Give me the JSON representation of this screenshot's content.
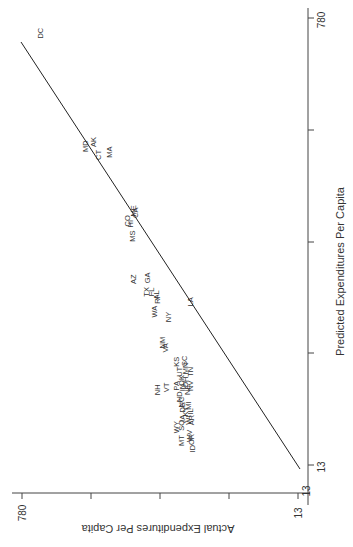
{
  "chart_data": {
    "type": "scatter",
    "orientation_note": "figure rotated 90 degrees counterclockwise",
    "title": "",
    "xlabel": "Predicted Expenditures Per Capita",
    "ylabel": "Actual Expenditures Per Capita",
    "xlim": [
      13,
      780
    ],
    "ylim": [
      13,
      780
    ],
    "x_tick_labels": [
      "13",
      "780"
    ],
    "y_tick_labels": [
      "13",
      "780"
    ],
    "grid": false,
    "legend": null,
    "fit_line": {
      "from": [
        13,
        13
      ],
      "to": [
        780,
        780
      ],
      "label": "45-degree reference / fitted line"
    },
    "points": [
      {
        "label": "DC",
        "predicted": 754,
        "actual": 723
      },
      {
        "label": "MD",
        "predicted": 560,
        "actual": 596
      },
      {
        "label": "AK",
        "predicted": 567,
        "actual": 574
      },
      {
        "label": "CT",
        "predicted": 545,
        "actual": 560
      },
      {
        "label": "MA",
        "predicted": 550,
        "actual": 530
      },
      {
        "label": "ME",
        "predicted": 449,
        "actual": 463
      },
      {
        "label": "CA",
        "predicted": 446,
        "actual": 458
      },
      {
        "label": "CO",
        "predicted": 432,
        "actual": 480
      },
      {
        "label": "HI",
        "predicted": 427,
        "actual": 471
      },
      {
        "label": "MS",
        "predicted": 406,
        "actual": 466
      },
      {
        "label": "GA",
        "predicted": 334,
        "actual": 424
      },
      {
        "label": "AZ",
        "predicted": 332,
        "actual": 463
      },
      {
        "label": "TX",
        "predicted": 310,
        "actual": 427
      },
      {
        "label": "FL",
        "predicted": 310,
        "actual": 413
      },
      {
        "label": "AL",
        "predicted": 305,
        "actual": 399
      },
      {
        "label": "RI",
        "predicted": 296,
        "actual": 396
      },
      {
        "label": "WA",
        "predicted": 276,
        "actual": 404
      },
      {
        "label": "NY",
        "predicted": 267,
        "actual": 365
      },
      {
        "label": "LA",
        "predicted": 293,
        "actual": 304
      },
      {
        "label": "NM",
        "predicted": 223,
        "actual": 382
      },
      {
        "label": "VA",
        "predicted": 214,
        "actual": 374
      },
      {
        "label": "KS",
        "predicted": 190,
        "actual": 343
      },
      {
        "label": "SC",
        "predicted": 192,
        "actual": 321
      },
      {
        "label": "MN",
        "predicted": 179,
        "actual": 318
      },
      {
        "label": "UT",
        "predicted": 173,
        "actual": 335
      },
      {
        "label": "OK",
        "predicted": 158,
        "actual": 329
      },
      {
        "label": "OH",
        "predicted": 155,
        "actual": 318
      },
      {
        "label": "TN",
        "predicted": 173,
        "actual": 304
      },
      {
        "label": "IN",
        "predicted": 146,
        "actual": 326
      },
      {
        "label": "NE",
        "predicted": 142,
        "actual": 313
      },
      {
        "label": "NV",
        "predicted": 149,
        "actual": 304
      },
      {
        "label": "NH",
        "predicted": 142,
        "actual": 396
      },
      {
        "label": "VT",
        "predicted": 146,
        "actual": 371
      },
      {
        "label": "PA",
        "predicted": 149,
        "actual": 343
      },
      {
        "label": "ND",
        "predicted": 130,
        "actual": 335
      },
      {
        "label": "NC",
        "predicted": 121,
        "actual": 329
      },
      {
        "label": "DE",
        "predicted": 112,
        "actual": 326
      },
      {
        "label": "KY",
        "predicted": 105,
        "actual": 318
      },
      {
        "label": "MI",
        "predicted": 115,
        "actual": 310
      },
      {
        "label": "IL",
        "predicted": 105,
        "actual": 304
      },
      {
        "label": "WI",
        "predicted": 90,
        "actual": 310
      },
      {
        "label": "AR",
        "predicted": 90,
        "actual": 301
      },
      {
        "label": "IA",
        "predicted": 93,
        "actual": 326
      },
      {
        "label": "SQ",
        "predicted": 81,
        "actual": 329
      },
      {
        "label": "WY",
        "predicted": 78,
        "actual": 343
      },
      {
        "label": "MT",
        "predicted": 55,
        "actual": 329
      },
      {
        "label": "WV",
        "predicted": 63,
        "actual": 307
      },
      {
        "label": "OR",
        "predicted": 57,
        "actual": 301
      },
      {
        "label": "ID",
        "predicted": 41,
        "actual": 299
      }
    ]
  },
  "layout": {
    "pred_axis": {
      "x": 308,
      "y_top": 18,
      "y_bottom": 465,
      "v_top": 780,
      "v_bottom": 13,
      "ticks_y": [
        18,
        130,
        242,
        353,
        465
      ]
    },
    "act_axis": {
      "y": 493,
      "x_left": 22,
      "x_right": 298,
      "v_left": 780,
      "v_right": 13,
      "ticks_x": [
        22,
        91,
        160,
        229,
        298
      ]
    },
    "fit_line_px": {
      "x1": 21,
      "y1": 22,
      "x2": 300,
      "y2": 469
    }
  }
}
